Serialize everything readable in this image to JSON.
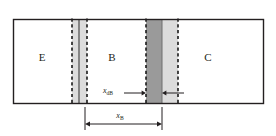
{
  "figure": {
    "type": "semiconductor-cross-section",
    "background_color": "#ffffff",
    "outline_color": "#231f20",
    "fill_color": "#ffffff",
    "depletion_light_color": "#dcdcdc",
    "depletion_dark_color": "#9a9a9a",
    "dashed_line_color": "#1a1a1a",
    "dimension_line_color": "#231f20"
  },
  "device": {
    "frame": {
      "x": 13,
      "y": 19,
      "width": 251,
      "height": 85
    },
    "regions": [
      {
        "id": "emitter",
        "label": "E",
        "label_x": 42,
        "label_y": 61
      },
      {
        "id": "base",
        "label": "B",
        "label_x": 112,
        "label_y": 61
      },
      {
        "id": "collector",
        "label": "C",
        "label_x": 208,
        "label_y": 61
      }
    ],
    "junctions": [
      {
        "id": "emitter-base-junction",
        "dashed_left_x": 72,
        "dashed_right_x": 87,
        "metallurgical_x": 79,
        "light_fill_from": 72,
        "light_fill_to": 87,
        "dark_fill_from": 78,
        "dark_fill_to": 80
      },
      {
        "id": "base-collector-junction",
        "dashed_left_x": 146,
        "dashed_right_x": 178,
        "metallurgical_x": 162,
        "light_fill_from": 162,
        "light_fill_to": 178,
        "dark_fill_from": 146,
        "dark_fill_to": 162
      }
    ]
  },
  "annotations": {
    "x_dB": {
      "base": "x",
      "subscript": "dB",
      "text_x": 113,
      "text_y": 93,
      "arrow_left_start_x": 124,
      "arrow_left_end_x": 146,
      "arrow_right_start_x": 184,
      "arrow_right_end_x": 162,
      "arrow_y": 93,
      "measures": "base-side depletion width"
    },
    "x_B": {
      "base": "x",
      "subscript": "B",
      "text_x": 120,
      "text_y": 118,
      "dim_left_x": 85,
      "dim_right_x": 162,
      "dim_y": 124,
      "tick_top_y": 107,
      "tick_bottom_y": 130,
      "measures": "neutral base width"
    }
  }
}
